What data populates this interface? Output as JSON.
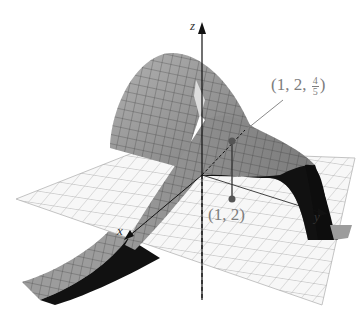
{
  "figure": {
    "type": "3d-surface-with-tangent-plane",
    "axes": {
      "z_label": "z",
      "x_label": "x",
      "y_label": "y"
    },
    "point_on_surface": {
      "label_prefix": "(1, 2, ",
      "frac_num": "4",
      "frac_den": "5",
      "label_suffix": ")",
      "coords": [
        1,
        2,
        0.8
      ]
    },
    "point_on_plane": {
      "label": "(1, 2)",
      "coords": [
        1,
        2
      ]
    },
    "colors": {
      "surface_light": "#a8a8a8",
      "surface_mid": "#8c8c8c",
      "surface_dark": "#111111",
      "plane_fill": "#f7f7f7",
      "grid_line": "#9a9a9a",
      "label_gray": "#7d7d7d",
      "axis": "#111111"
    }
  }
}
